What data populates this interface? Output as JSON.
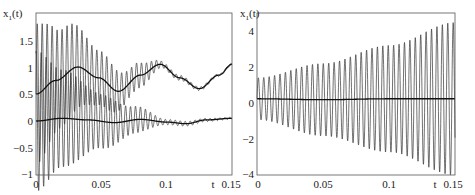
{
  "chart_data": [
    {
      "type": "line",
      "title": "",
      "xlabel": "t",
      "ylabel": "x_1(t)",
      "xlim": [
        0,
        0.15
      ],
      "ylim": [
        -1,
        2
      ],
      "xticks": [
        "0",
        "0.05",
        "0.1",
        "0.15"
      ],
      "yticks": [
        "-1",
        "-0.5",
        "0",
        "0.5",
        "1",
        "1.5"
      ],
      "grid": false,
      "legend": null,
      "series": [
        {
          "name": "upper smooth (averaged) solution",
          "style": "solid thick",
          "x": [
            0,
            0.015,
            0.032,
            0.048,
            0.063,
            0.08,
            0.095,
            0.11,
            0.125,
            0.14,
            0.15
          ],
          "values": [
            0.5,
            0.75,
            1.0,
            0.8,
            0.55,
            0.85,
            1.05,
            0.8,
            0.6,
            0.85,
            1.05
          ]
        },
        {
          "name": "lower smooth (averaged) solution",
          "style": "solid thick",
          "x": [
            0,
            0.02,
            0.04,
            0.06,
            0.08,
            0.1,
            0.115,
            0.13,
            0.15
          ],
          "values": [
            0.0,
            0.05,
            0.02,
            -0.03,
            0.03,
            -0.02,
            -0.05,
            0.02,
            0.05
          ]
        },
        {
          "name": "fast oscillating solution (decaying)",
          "style": "thin",
          "envelope_x": [
            0,
            0.02,
            0.05,
            0.075,
            0.1,
            0.15
          ],
          "envelope_amplitude": [
            1.3,
            0.9,
            0.5,
            0.25,
            0.05,
            0.02
          ],
          "period": 0.0038
        }
      ]
    },
    {
      "type": "line",
      "title": "",
      "xlabel": "t",
      "ylabel": "x_1(t)",
      "xlim": [
        0,
        0.15
      ],
      "ylim": [
        -4,
        4.5
      ],
      "xticks": [
        "0",
        "0.05",
        "0.1",
        "0.15"
      ],
      "yticks": [
        "-4",
        "-2",
        "0",
        "2",
        "4"
      ],
      "grid": false,
      "legend": null,
      "series": [
        {
          "name": "smooth (averaged) solution",
          "style": "solid thick",
          "x": [
            0,
            0.05,
            0.1,
            0.15
          ],
          "values": [
            0.0,
            -0.05,
            0.0,
            0.0
          ]
        },
        {
          "name": "fast oscillating solution (growing)",
          "style": "thin",
          "envelope_x": [
            0,
            0.05,
            0.1,
            0.15
          ],
          "envelope_amplitude": [
            1.1,
            1.9,
            2.8,
            4.0
          ],
          "period": 0.0041
        }
      ]
    }
  ],
  "panels": [
    {
      "ylabel_main": "x",
      "ylabel_sub": "1",
      "ylabel_arg": "(t)",
      "xlabel": "t",
      "xtick_labels": [
        "0",
        "0.05",
        "0.1",
        "0.15"
      ],
      "ytick_labels": [
        "1.5",
        "1",
        "0.5",
        "0",
        "−0.5",
        "−1"
      ]
    },
    {
      "ylabel_main": "x",
      "ylabel_sub": "1",
      "ylabel_arg": "(t)",
      "xlabel": "t",
      "xtick_labels": [
        "0",
        "0.05",
        "0.1",
        "0.15"
      ],
      "ytick_labels": [
        "4",
        "2",
        "0",
        "−2",
        "−4"
      ]
    }
  ]
}
